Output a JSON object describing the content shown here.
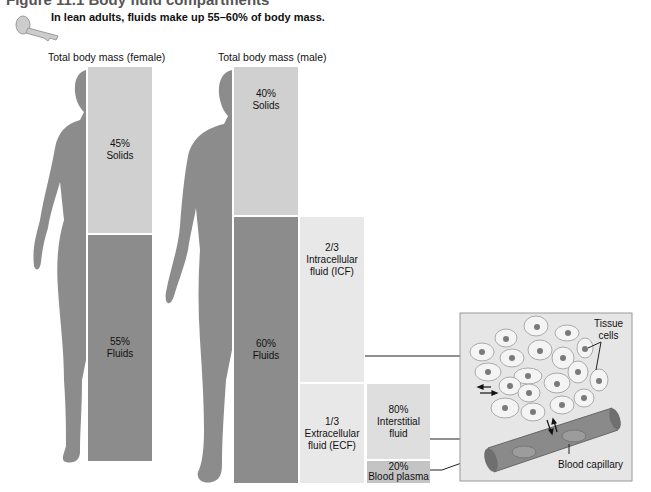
{
  "figure_title": "Figure 11.1  Body fluid compartments",
  "key_point": "In lean adults, fluids make up 55–60% of body mass.",
  "key_icon": "key-icon",
  "female": {
    "heading": "Total body mass (female)",
    "solids": {
      "value": "45%",
      "label": "Solids",
      "fraction": 0.45
    },
    "fluids": {
      "value": "55%",
      "label": "Fluids",
      "fraction": 0.55
    }
  },
  "male": {
    "heading": "Total body mass (male)",
    "solids": {
      "value": "40%",
      "label": "Solids",
      "fraction": 0.4
    },
    "fluids": {
      "value": "60%",
      "label": "Fluids",
      "fraction": 0.6
    }
  },
  "icf": {
    "value": "2/3",
    "line1": "Intracellular",
    "line2": "fluid (ICF)"
  },
  "ecf": {
    "value": "1/3",
    "line1": "Extracellular",
    "line2": "fluid (ECF)"
  },
  "interstitial": {
    "value": "80%",
    "line1": "Interstitial",
    "line2": "fluid"
  },
  "plasma": {
    "value": "20%",
    "label": "Blood plasma"
  },
  "inset": {
    "tissue_cells_line1": "Tissue",
    "tissue_cells_line2": "cells",
    "capillary_label": "Blood capillary"
  },
  "colors": {
    "silhouette": "#8c8c8c",
    "solids": "#d0d0d0",
    "fluids": "#8c8c8c",
    "compartment_light": "#e8e8e8",
    "capillary": "#8a8a8a",
    "inset_bg": "#e6e6e6"
  }
}
